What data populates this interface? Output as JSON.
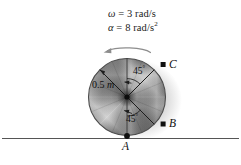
{
  "figure": {
    "name": "rotating-disk-diagram",
    "background_color": "#ffffff"
  },
  "kinematics": {
    "omega": {
      "symbol": "ω",
      "equals": "=",
      "value": "3",
      "unit": "rad/s",
      "full_text": "ω = 3 rad/s"
    },
    "alpha": {
      "symbol": "α",
      "equals": "=",
      "value": "8",
      "unit": "rad/s",
      "unit_exponent": "2",
      "full_text": "α = 8 rad/s²"
    }
  },
  "disk": {
    "radius_label": {
      "value": "0.5",
      "unit": "m",
      "full_text": "0.5 m"
    },
    "center_color": "#3a3a3a",
    "rim_color": "#4a4a4a",
    "fill_light": "#f2f2f2",
    "fill_dark": "#6e6e6e"
  },
  "angles": {
    "top": {
      "value": "45",
      "degree_symbol": "°",
      "full_text": "45°"
    },
    "bottom": {
      "value": "45",
      "degree_symbol": "°",
      "full_text": "45°"
    }
  },
  "points": {
    "a": {
      "label": "A"
    },
    "b": {
      "label": "B"
    },
    "c": {
      "label": "C"
    }
  },
  "rotation_arrow": {
    "direction": "counterclockwise",
    "color": "#8a8a8a"
  },
  "ground": {
    "color": "#555555"
  }
}
